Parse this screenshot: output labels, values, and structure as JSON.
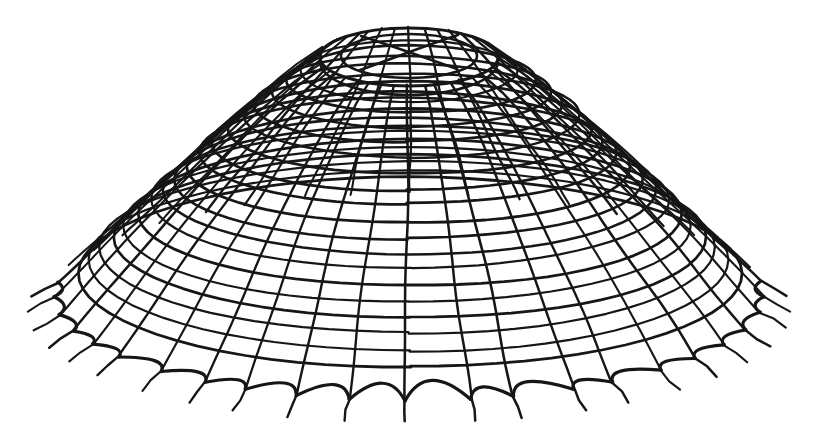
{
  "figure": {
    "kind": "hand-drawn-ink-illustration",
    "background_color": "#ffffff",
    "ink_color": "#161616"
  },
  "drawing": {
    "canvas": {
      "width": 819,
      "height": 430
    },
    "axis_x": 409,
    "profile": {
      "rx0": 89,
      "rx_span": 266,
      "rx_exp": 0.7,
      "ry0": 29,
      "ry_span": 75,
      "cy0": 57,
      "cy_span": 240,
      "cy_exp": 0.8
    },
    "net": {
      "meridian_count": 40,
      "meridian_step_deg": 9,
      "meridian_samples": 26,
      "hoop_count": 18,
      "hoop_divisor": 20,
      "hoop_exp": 1.25,
      "hoop_samples": 72,
      "wobble_meridian": 1.3,
      "wobble_hoop": 1.1,
      "angle_jitter_deg": 2.4
    },
    "skirt": {
      "cusp_min_index": -11,
      "cusp_max_index": 11,
      "front_limit_deg": 99.5,
      "sag_ratio": 0.55,
      "sag_base": 5,
      "tail_len": 20,
      "tail_side_boost": 0.5,
      "tail_flatten": 0.55,
      "rim_center_y": 297
    },
    "collar": {
      "gap_mask": {
        "cx": 409,
        "cy": 59,
        "rx": 98,
        "ry": 40
      },
      "band": {
        "cx": 409,
        "cy": 61,
        "rx": 89,
        "ry": 34
      },
      "outer_ring": {
        "cx": 409,
        "cy": 57,
        "rx": 89,
        "ry": 29
      },
      "inner_ring": {
        "cx": 409,
        "cy": 56,
        "rx": 68,
        "ry": 22
      }
    },
    "cross_bracing": {
      "strut_a": [
        [
          361,
          36
        ],
        [
          392,
          46
        ],
        [
          426,
          58
        ],
        [
          457,
          69
        ]
      ],
      "strut_b": [
        [
          458,
          35
        ],
        [
          427,
          45
        ],
        [
          391,
          59
        ],
        [
          360,
          70
        ]
      ]
    },
    "strokes": {
      "meridian": 2.3,
      "hoop": 2.4,
      "scallop": 3.2,
      "tail": 2.6,
      "outer_ring": 3.0,
      "inner_ring": 2.6,
      "band": 2.6,
      "cross": 2.6
    }
  }
}
